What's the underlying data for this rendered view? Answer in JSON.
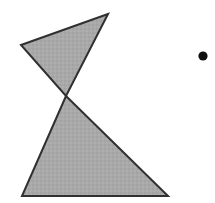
{
  "canvas": {
    "width": 215,
    "height": 203,
    "background_color": "#ffffff"
  },
  "figure": {
    "stroke_color": "#303030",
    "stroke_width": 2,
    "fill_color": "#a8a8a8",
    "dot_color": "#101010"
  },
  "shapes": [
    {
      "name": "upper-triangle",
      "type": "triangle",
      "points": "108,14 21,45 66,96",
      "vertices": [
        {
          "label": "apex-top-right",
          "x": 108,
          "y": 14
        },
        {
          "label": "left",
          "x": 21,
          "y": 45
        },
        {
          "label": "crossing",
          "x": 66,
          "y": 96
        }
      ],
      "fill": "#a8a8a8",
      "stroke": "#303030"
    },
    {
      "name": "lower-triangle",
      "type": "triangle",
      "points": "66,96 22,196 168,196",
      "vertices": [
        {
          "label": "crossing",
          "x": 66,
          "y": 96
        },
        {
          "label": "bottom-left",
          "x": 22,
          "y": 196
        },
        {
          "label": "bottom-right",
          "x": 168,
          "y": 196
        }
      ],
      "fill": "#a8a8a8",
      "stroke": "#303030"
    },
    {
      "name": "dot",
      "type": "circle",
      "cx": 203,
      "cy": 56,
      "r": 4.6,
      "fill": "#101010"
    }
  ]
}
